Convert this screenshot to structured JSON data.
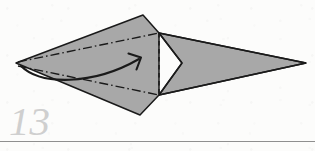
{
  "page": {
    "width": 315,
    "height": 151,
    "background_color": "#fcfcfb",
    "kind": "origami-instruction-diagram"
  },
  "step": {
    "number_label": "13",
    "number_color": "#cfcfcf"
  },
  "divider": {
    "color": "#8f8f8f",
    "y": 141.5,
    "x_start": 0,
    "x_end": 315,
    "thickness": 1
  },
  "diagram": {
    "fill_color": "#a8a8a8",
    "outline_color": "#1a1a1a",
    "crease_color": "#1a1a1a",
    "arrow_color": "#1a1a1a",
    "shapes": {
      "left_kite_points": "16,63 143,15 159,33 159,95 140,115",
      "right_dart_points": "159,33 306,63 159,95 182,63",
      "notch_apex": "182,63"
    },
    "creases": {
      "upper_dash_dot": "18,62 159,33",
      "lower_dash_dot": "18,66 159,95",
      "vertical_dashed": "159,33 159,95",
      "dash_dot_pattern": "9 3 1.6 3",
      "dashed_pattern": "4.5 3.5"
    },
    "motion_arrow": {
      "path": "M 21,66 C 40,85 92,86 139,59",
      "head_points": "129,54 141,57 137,69",
      "description": "curved fold-over arrow sweeping left tip to the right"
    }
  }
}
